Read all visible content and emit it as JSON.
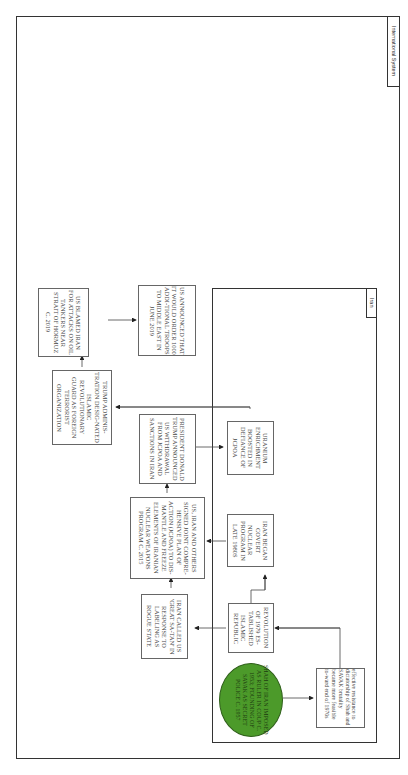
{
  "frames": {
    "outer_label": "International System",
    "inner_label": "Iran"
  },
  "nodes": {
    "us_blamed_iran": "US BLAMED IRAN FOR ATTACKS ON OIL TANKERS NEAR STRAIT OF HORMUZ C. 2019",
    "us_troops": "US ANNOUNCED THAT IT WOULD ORDER 1000 ADDI-TIONAL TROOPS TO MIDDLE EAST IN JUNE 2019",
    "trump_irgc": "TRUMP ADMINIS-TRATION DESIG-NATED ISLAMIC REVOLUTIONARY GUARD AS FOREIGN TERRORIST ORGANIZATION",
    "trump_withdrawal": "PRESIDENT DONALD TRUMP ANNOUNCED US WITHDRAWAL FROM JCPOA AND SANCTIONS IN IRAN",
    "uranium": "URANIUM ENRICHMENT BOOSTED IN DEFIANCE OF JCPOA",
    "jcpoa": "US, IRAN AND OTHERS SIGNED JOINT COMPRE-HENSIVE PLAN OF ACTION (JCPOA) TO DIS-MANTLE AND FREEZE ELEMENTS OF IRANIAN NUCLEAR WEAPONS PROGRAM C. 2015",
    "covert_nuclear": "IRAN BEGAN COVERT NUCLEAR PROGRAM IN LATE 1980S",
    "great_satan": "IRAN CALLED US 'GREAT SA-TAN' IN RESPONSE TO LABELING AS ROGUE STATE",
    "revolution": "REVOLUTION OF 1979 ES-TABLISHED ISLAMIC REPUBLIC",
    "shah": "SHAH OF IRAN IMPOSED AS RULER IN COUP C. 1953; FOUNDING OF SAVAK AS SECRET POLICE C. 1957",
    "resistance": "effective resistance to dictatorship of Shah and SAVAK brutality became more feasible to-ward end of 1970s"
  },
  "colors": {
    "root_node": "#4c9a2a",
    "border": "#333333"
  }
}
